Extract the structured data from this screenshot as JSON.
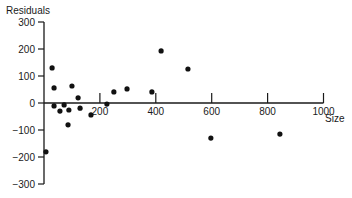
{
  "chart_data": {
    "type": "scatter",
    "title": "",
    "xlabel": "Size",
    "ylabel": "Residuals",
    "xlim": [
      0,
      1000
    ],
    "ylim": [
      -300,
      300
    ],
    "x_ticks": [
      200,
      400,
      600,
      800,
      1000
    ],
    "y_ticks": [
      300,
      200,
      100,
      0,
      -100,
      -200,
      -300
    ],
    "grid": false,
    "legend": null,
    "points": [
      {
        "x": 7,
        "y": -181
      },
      {
        "x": 29,
        "y": 130
      },
      {
        "x": 36,
        "y": 56
      },
      {
        "x": 36,
        "y": -11
      },
      {
        "x": 57,
        "y": -30
      },
      {
        "x": 72,
        "y": -7
      },
      {
        "x": 89,
        "y": -26
      },
      {
        "x": 86,
        "y": -81
      },
      {
        "x": 100,
        "y": 63
      },
      {
        "x": 122,
        "y": 19
      },
      {
        "x": 129,
        "y": -19
      },
      {
        "x": 168,
        "y": -44
      },
      {
        "x": 225,
        "y": -4
      },
      {
        "x": 250,
        "y": 41
      },
      {
        "x": 297,
        "y": 52
      },
      {
        "x": 386,
        "y": 41
      },
      {
        "x": 419,
        "y": 193
      },
      {
        "x": 515,
        "y": 126
      },
      {
        "x": 597,
        "y": -130
      },
      {
        "x": 844,
        "y": -115
      }
    ]
  }
}
